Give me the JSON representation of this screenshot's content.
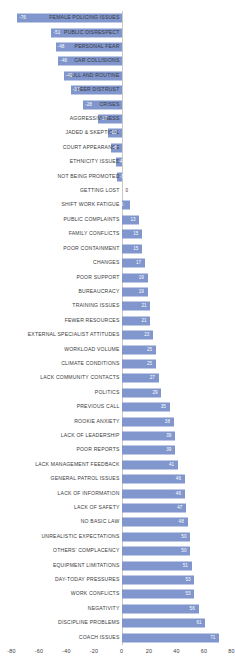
{
  "chart_data": {
    "type": "bar",
    "orientation": "horizontal",
    "title": "",
    "subtitle": "",
    "xlabel": "",
    "ylabel": "",
    "xlim": [
      -80,
      80
    ],
    "xticks": [
      -80,
      -60,
      -40,
      -20,
      0,
      20,
      40,
      60,
      80
    ],
    "xticklabels": [
      "-80",
      "-60",
      "-40",
      "-20",
      "0",
      "20",
      "40",
      "60",
      "80"
    ],
    "grid": false,
    "legend": null,
    "bar_color": "#8096cd",
    "value_label_color": "#ffffff",
    "categories": [
      "FEMALE POLICING ISSUES",
      "PUBLIC DISRESPECT",
      "PERSONAL FEAR",
      "CAR COLLISIONS",
      "LULL AND ROUTINE",
      "PEER DISTRUST",
      "CRISES",
      "AGGRESSIVENESS",
      "JADED & SKEPTICAL",
      "COURT APPEARANCE",
      "ETHNICITY ISSUES",
      "NOT BEING PROMOTED",
      "GETTING LOST",
      "SHIFT WORK FATIGUE",
      "PUBLIC COMPLAINTS",
      "FAMILY CONFLICTS",
      "POOR CONTAINMENT",
      "CHANGES",
      "POOR SUPPORT",
      "BUREAUCRACY",
      "TRAINING ISSUES",
      "FEWER RESOURCES",
      "EXTERNAL SPECIALIST ATTITUDES",
      "WORKLOAD VOLUME",
      "CLIMATE CONDITIONS",
      "LACK COMMUNITY CONTACTS",
      "POLITICS",
      "PREVIOUS CALL",
      "ROOKIE ANXIETY",
      "LACK OF LEADERSHIP",
      "POOR REPORTS",
      "LACK MANAGEMENT FEEDBACK",
      "GENERAL PATROL ISSUES",
      "LACK OF INFORMATION",
      "LACK OF SAFETY",
      "NO BASIC LAW",
      "UNREALISTIC EXPECTATIONS",
      "OTHERS' COMPLACENCY",
      "EQUIPMENT LIMITATIONS",
      "DAY-TODAY PRESSURES",
      "WORK CONFLICTS",
      "NEGATIVITY",
      "DISCIPLINE PROBLEMS",
      "COACH ISSUES"
    ],
    "values": [
      -76,
      -51,
      -48,
      -46,
      -42,
      -37,
      -28,
      -17,
      -10,
      -8,
      -4,
      -3,
      0,
      6,
      13,
      15,
      15,
      17,
      19,
      19,
      21,
      21,
      23,
      25,
      25,
      27,
      29,
      35,
      38,
      39,
      39,
      41,
      46,
      46,
      47,
      48,
      50,
      50,
      51,
      53,
      53,
      56,
      61,
      71
    ],
    "value_labels": [
      "-76",
      "-51",
      "-48",
      "-46",
      "-42",
      "-37",
      "-28",
      "-17",
      "-10",
      "-8",
      "-4",
      "-3",
      "0",
      "6",
      "13",
      "15",
      "15",
      "17",
      "19",
      "19",
      "21",
      "21",
      "23",
      "25",
      "25",
      "27",
      "29",
      "35",
      "38",
      "39",
      "39",
      "41",
      "46",
      "46",
      "47",
      "48",
      "50",
      "50",
      "51",
      "53",
      "53",
      "56",
      "61",
      "71"
    ]
  }
}
